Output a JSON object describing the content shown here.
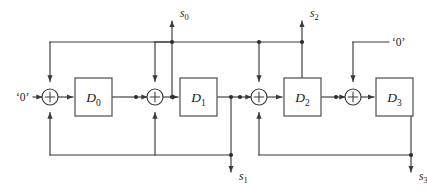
{
  "figure": {
    "width": 427,
    "height": 195,
    "background_color": "#ffffff",
    "wire_color": "#3a3a3a",
    "box_stroke_color": "#555555",
    "text_color": "#1a1a1a"
  },
  "registers": [
    {
      "id": "D0",
      "name": "D",
      "index": "0"
    },
    {
      "id": "D1",
      "name": "D",
      "index": "1"
    },
    {
      "id": "D2",
      "name": "D",
      "index": "2"
    },
    {
      "id": "D3",
      "name": "D",
      "index": "3"
    }
  ],
  "adders": [
    {
      "id": "adder-0",
      "symbol": "+"
    },
    {
      "id": "adder-1",
      "symbol": "+"
    },
    {
      "id": "adder-2",
      "symbol": "+"
    },
    {
      "id": "adder-3",
      "symbol": "+"
    }
  ],
  "inputs": [
    {
      "id": "input-zero-left",
      "label": "‘0’",
      "position": "left"
    },
    {
      "id": "input-zero-right",
      "label": "‘0’",
      "position": "top-right"
    }
  ],
  "outputs": [
    {
      "id": "output-s0",
      "name": "s",
      "index": "0",
      "position": "top"
    },
    {
      "id": "output-s1",
      "name": "s",
      "index": "1",
      "position": "bottom"
    },
    {
      "id": "output-s2",
      "name": "s",
      "index": "2",
      "position": "top"
    },
    {
      "id": "output-s3",
      "name": "s",
      "index": "3",
      "position": "bottom"
    }
  ],
  "signals": {
    "s0": "s₀",
    "s1": "s₁",
    "s2": "s₂",
    "s3": "s₃",
    "zero": "‘0’"
  }
}
